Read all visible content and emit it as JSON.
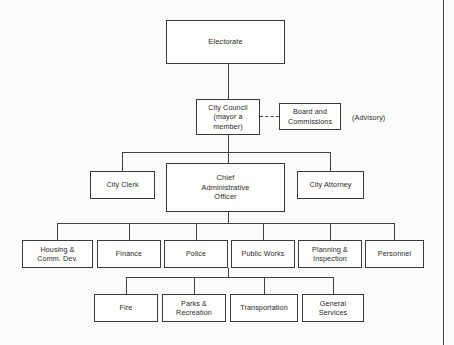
{
  "chart_data": {
    "type": "diagram",
    "nodes": [
      {
        "id": "electorate",
        "label": "Electorate",
        "level": 0,
        "x": 166,
        "y": 20,
        "w": 119,
        "h": 44
      },
      {
        "id": "city-council",
        "label": "City Council\n(mayor a\nmember)",
        "level": 1,
        "x": 196,
        "y": 99,
        "w": 64,
        "h": 36
      },
      {
        "id": "board-commissions",
        "label": "Board and\nCommissions",
        "level": 1,
        "x": 279,
        "y": 103,
        "w": 62,
        "h": 27
      },
      {
        "id": "city-clerk",
        "label": "City Clerk",
        "level": 2,
        "x": 90,
        "y": 171,
        "w": 65,
        "h": 28
      },
      {
        "id": "cao",
        "label": "Chief\nAdministrative\nOfficer",
        "level": 2,
        "x": 166,
        "y": 163,
        "w": 119,
        "h": 49
      },
      {
        "id": "city-attorney",
        "label": "City Attorney",
        "level": 2,
        "x": 297,
        "y": 171,
        "w": 67,
        "h": 28
      },
      {
        "id": "housing",
        "label": "Housing &\nComm. Dev.",
        "level": 3,
        "x": 22,
        "y": 240,
        "w": 71,
        "h": 28
      },
      {
        "id": "finance",
        "label": "Finance",
        "level": 3,
        "x": 97,
        "y": 240,
        "w": 64,
        "h": 28
      },
      {
        "id": "police",
        "label": "Police",
        "level": 3,
        "x": 164,
        "y": 240,
        "w": 64,
        "h": 28
      },
      {
        "id": "public-works",
        "label": "Public Works",
        "level": 3,
        "x": 231,
        "y": 240,
        "w": 64,
        "h": 28
      },
      {
        "id": "planning",
        "label": "Planning &\nInspection",
        "level": 3,
        "x": 298,
        "y": 240,
        "w": 64,
        "h": 28
      },
      {
        "id": "personnel",
        "label": "Personnel",
        "level": 3,
        "x": 365,
        "y": 240,
        "w": 59,
        "h": 28
      },
      {
        "id": "fire",
        "label": "Fire",
        "level": 4,
        "x": 94,
        "y": 294,
        "w": 64,
        "h": 28
      },
      {
        "id": "parks",
        "label": "Parks &\nRecreation",
        "level": 4,
        "x": 162,
        "y": 294,
        "w": 64,
        "h": 28
      },
      {
        "id": "transportation",
        "label": "Transportation",
        "level": 4,
        "x": 230,
        "y": 294,
        "w": 68,
        "h": 28
      },
      {
        "id": "general-services",
        "label": "General\nServices",
        "level": 4,
        "x": 302,
        "y": 294,
        "w": 62,
        "h": 28
      }
    ],
    "annotations": [
      {
        "id": "advisory-note",
        "text": "(Advisory)",
        "x": 352,
        "y": 113
      }
    ],
    "edges": [
      {
        "from": "electorate",
        "to": "city-council",
        "style": "solid"
      },
      {
        "from": "city-council",
        "to": "board-commissions",
        "style": "dashed"
      },
      {
        "from": "city-council",
        "to": "city-clerk",
        "style": "solid"
      },
      {
        "from": "city-council",
        "to": "cao",
        "style": "solid"
      },
      {
        "from": "city-council",
        "to": "city-attorney",
        "style": "solid"
      },
      {
        "from": "cao",
        "to": "housing",
        "style": "solid"
      },
      {
        "from": "cao",
        "to": "finance",
        "style": "solid"
      },
      {
        "from": "cao",
        "to": "police",
        "style": "solid"
      },
      {
        "from": "cao",
        "to": "public-works",
        "style": "solid"
      },
      {
        "from": "cao",
        "to": "planning",
        "style": "solid"
      },
      {
        "from": "cao",
        "to": "personnel",
        "style": "solid"
      },
      {
        "from": "cao",
        "to": "fire",
        "style": "solid"
      },
      {
        "from": "cao",
        "to": "parks",
        "style": "solid"
      },
      {
        "from": "cao",
        "to": "transportation",
        "style": "solid"
      },
      {
        "from": "cao",
        "to": "general-services",
        "style": "solid"
      }
    ],
    "colors": {
      "background": "#fbfbfa",
      "box_fill": "#fdfdfc",
      "line": "#3f3f3f",
      "text": "#2b2b2b"
    }
  },
  "page_rule": {
    "x": 443
  }
}
